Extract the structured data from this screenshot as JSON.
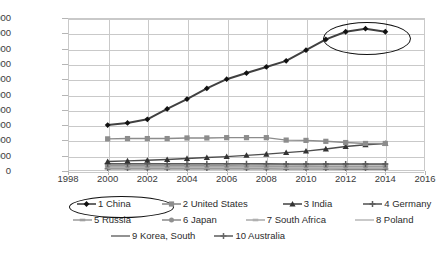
{
  "chart_data": {
    "type": "line",
    "title": "",
    "xlabel": "",
    "ylabel": "",
    "x": [
      2000,
      2001,
      2002,
      2003,
      2004,
      2005,
      2006,
      2007,
      2008,
      2009,
      2010,
      2011,
      2012,
      2013,
      2014
    ],
    "xlim": [
      1998,
      2016
    ],
    "ylim": [
      0,
      5000000
    ],
    "xticks": [
      1998,
      2000,
      2002,
      2004,
      2006,
      2008,
      2010,
      2012,
      2014,
      2016
    ],
    "yticks": [
      0,
      500000,
      1000000,
      1500000,
      2000000,
      2500000,
      3000000,
      3500000,
      4000000,
      4500000,
      5000000
    ],
    "ytick_labels": [
      "0",
      "500000",
      "1000000",
      "1500000",
      "2000000",
      "2500000",
      "3000000",
      "3500000",
      "4000000",
      "4500000",
      "5000000"
    ],
    "xtick_labels": [
      "1998",
      "2000",
      "2002",
      "2004",
      "2006",
      "2008",
      "2010",
      "2012",
      "2014",
      "2016"
    ],
    "grid": true,
    "legend_position": "bottom",
    "series": [
      {
        "name": "1 China",
        "marker": "diamond",
        "color": "#404040",
        "values": [
          1500000,
          1570000,
          1690000,
          2030000,
          2350000,
          2700000,
          3000000,
          3200000,
          3400000,
          3600000,
          3950000,
          4300000,
          4550000,
          4650000,
          4550000
        ]
      },
      {
        "name": "2 United States",
        "marker": "square",
        "color": "#8c8c8c",
        "values": [
          1050000,
          1060000,
          1060000,
          1060000,
          1080000,
          1080000,
          1090000,
          1090000,
          1090000,
          1010000,
          1000000,
          970000,
          930000,
          900000,
          900000
        ]
      },
      {
        "name": "3 India",
        "marker": "triangle",
        "color": "#4d4d4d",
        "values": [
          310000,
          330000,
          350000,
          375000,
          410000,
          440000,
          470000,
          510000,
          550000,
          600000,
          650000,
          720000,
          800000,
          860000,
          900000
        ]
      },
      {
        "name": "4 Germany",
        "marker": "cross",
        "color": "#5a5a5a",
        "values": [
          240000,
          240000,
          240000,
          240000,
          240000,
          240000,
          240000,
          240000,
          235000,
          230000,
          230000,
          230000,
          230000,
          230000,
          230000
        ]
      },
      {
        "name": "5 Russia",
        "marker": "dash",
        "color": "#a0a0a0",
        "values": [
          210000,
          210000,
          212000,
          212000,
          212000,
          212000,
          212000,
          212000,
          212000,
          205000,
          208000,
          210000,
          210000,
          210000,
          210000
        ]
      },
      {
        "name": "6 Japan",
        "marker": "circle",
        "color": "#909090",
        "values": [
          170000,
          170000,
          170000,
          170000,
          170000,
          170000,
          170000,
          168000,
          165000,
          160000,
          162000,
          160000,
          158000,
          158000,
          158000
        ]
      },
      {
        "name": "7 South Africa",
        "marker": "dash",
        "color": "#b0b0b0",
        "values": [
          130000,
          130000,
          132000,
          132000,
          135000,
          135000,
          135000,
          135000,
          135000,
          132000,
          132000,
          132000,
          130000,
          130000,
          130000
        ]
      },
      {
        "name": "8 Poland",
        "marker": "line",
        "color": "#bcbcbc",
        "values": [
          105000,
          105000,
          105000,
          105000,
          105000,
          105000,
          105000,
          105000,
          105000,
          100000,
          100000,
          100000,
          98000,
          98000,
          98000
        ]
      },
      {
        "name": "9 Korea, South",
        "marker": "line",
        "color": "#777777",
        "values": [
          85000,
          85000,
          85000,
          85000,
          85000,
          85000,
          85000,
          85000,
          85000,
          82000,
          82000,
          82000,
          80000,
          80000,
          80000
        ]
      },
      {
        "name": "10 Australia",
        "marker": "cross",
        "color": "#666666",
        "values": [
          70000,
          70000,
          70000,
          70000,
          70000,
          70000,
          70000,
          70000,
          70000,
          68000,
          68000,
          68000,
          66000,
          66000,
          66000
        ]
      }
    ],
    "annotations": [
      {
        "name": "peak-highlight-ellipse",
        "shape": "ellipse",
        "target": "1 China 2012-2014 peak"
      },
      {
        "name": "legend-highlight-ellipse",
        "shape": "ellipse",
        "target": "1 China legend entry"
      }
    ]
  }
}
